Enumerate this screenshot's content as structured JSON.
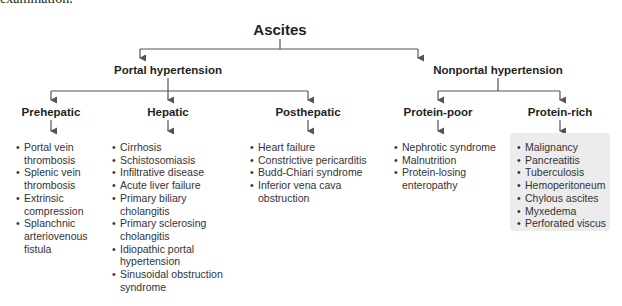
{
  "clipped_text": "examination.",
  "root": {
    "label": "Ascites"
  },
  "branches": [
    {
      "label": "Portal hypertension",
      "children": [
        {
          "label": "Prehepatic",
          "items": [
            "Portal vein thrombosis",
            "Splenic vein thrombosis",
            "Extrinsic compression",
            "Splanchnic arteriovenous fistula"
          ]
        },
        {
          "label": "Hepatic",
          "items": [
            "Cirrhosis",
            "Schistosomiasis",
            "Infiltrative disease",
            "Acute liver failure",
            "Primary biliary cholangitis",
            "Primary sclerosing cholangitis",
            "Idiopathic portal hypertension",
            "Sinusoidal obstruction syndrome"
          ]
        },
        {
          "label": "Posthepatic",
          "items": [
            "Heart failure",
            "Constrictive pericarditis",
            "Budd-Chiari syndrome",
            "Inferior vena cava obstruction"
          ]
        }
      ]
    },
    {
      "label": "Nonportal hypertension",
      "children": [
        {
          "label": "Protein-poor",
          "items": [
            "Nephrotic syndrome",
            "Malnutrition",
            "Protein-losing enteropathy"
          ]
        },
        {
          "label": "Protein-rich",
          "highlighted": true,
          "items": [
            "Malignancy",
            "Pancreatitis",
            "Tuberculosis",
            "Hemoperitoneum",
            "Chylous ascites",
            "Myxedema",
            "Perforated viscus"
          ]
        }
      ]
    }
  ],
  "colors": {
    "line": "#555555",
    "highlight_box": "#ececec",
    "text": "#231f20"
  }
}
